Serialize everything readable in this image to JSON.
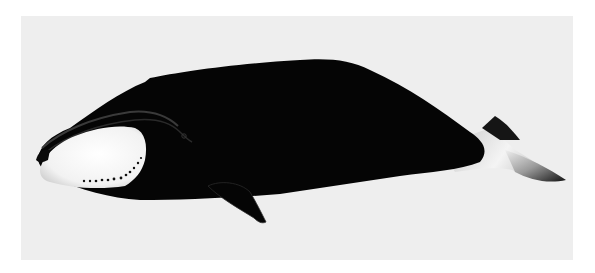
{
  "image": {
    "subject": "bowhead whale illustration",
    "description": "Side view of a bowhead whale facing left, black body with white chin patch and white tail stock, on a light gray background",
    "colors": {
      "background_outer": "#ffffff",
      "background_inner": "#eeeeee",
      "body": "#050505",
      "chin_patch": "#f6f6f6",
      "chin_spots": "#111111"
    }
  }
}
